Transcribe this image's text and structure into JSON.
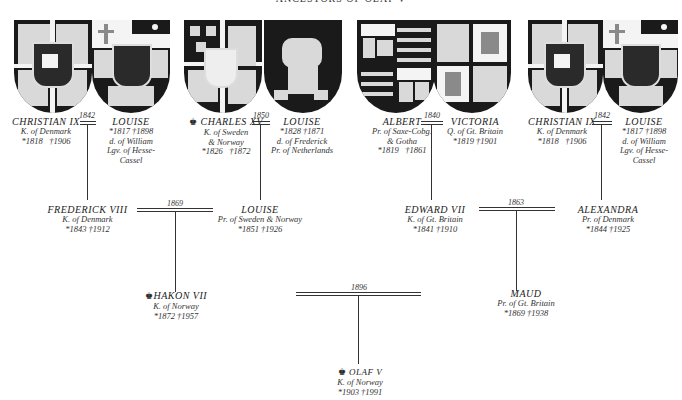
{
  "title": "ANCESTORS OF OLAF V",
  "colors": {
    "ink": "#222222",
    "background": "#ffffff",
    "shield_dark": "#1a1a1a",
    "shield_light": "#d9d9d9"
  },
  "generation1": [
    {
      "husband": {
        "name": "CHRISTIAN IX",
        "title": "K. of Denmark",
        "born": "*1818",
        "died": "†1906",
        "crown": false
      },
      "marriage_year": "1842",
      "wife": {
        "name": "LOUISE",
        "dates": "*1817   †1898",
        "title_line1": "d. of William",
        "title_line2": "Lgv. of Hesse-",
        "title_line3": "Cassel"
      }
    },
    {
      "husband": {
        "name": "CHARLES XV",
        "title_line1": "K. of Sweden",
        "title_line2": "& Norway",
        "born": "*1826",
        "died": "†1872",
        "crown": true
      },
      "marriage_year": "1850",
      "wife": {
        "name": "LOUISE",
        "dates": "*1828   †1871",
        "title_line1": "d. of Frederick",
        "title_line2": "Pr. of Netherlands"
      }
    },
    {
      "husband": {
        "name": "ALBERT",
        "title_line1": "Pr. of Saxe-Cobg.",
        "title_line2": "& Gotha",
        "born": "*1819",
        "died": "†1861"
      },
      "marriage_year": "1840",
      "wife": {
        "name": "VICTORIA",
        "title": "Q. of Gt. Britain",
        "dates": "*1819   †1901"
      }
    },
    {
      "husband": {
        "name": "CHRISTIAN IX",
        "title": "K. of Denmark",
        "born": "*1818",
        "died": "†1906"
      },
      "marriage_year": "1842",
      "wife": {
        "name": "LOUISE",
        "dates": "*1817   †1898",
        "title_line1": "d. of William",
        "title_line2": "Lgv. of Hesse-",
        "title_line3": "Cassel"
      }
    }
  ],
  "generation2": [
    {
      "husband": {
        "name": "FREDERICK VIII",
        "title": "K. of Denmark",
        "dates": "*1843   †1912"
      },
      "marriage_year": "1869",
      "wife": {
        "name": "LOUISE",
        "title": "Pr. of Sweden & Norway",
        "dates": "*1851   †1926"
      }
    },
    {
      "husband": {
        "name": "EDWARD VII",
        "title": "K. of Gt. Britain",
        "dates": "*1841   †1910"
      },
      "marriage_year": "1863",
      "wife": {
        "name": "ALEXANDRA",
        "title": "Pr. of Denmark",
        "dates": "*1844   †1925"
      }
    }
  ],
  "generation3": {
    "husband": {
      "name": "HAKON VII",
      "title": "K. of Norway",
      "dates": "*1872   †1957",
      "crown": true
    },
    "marriage_year": "1896",
    "wife": {
      "name": "MAUD",
      "title": "Pr. of Gt. Britain",
      "dates": "*1869   †1938"
    }
  },
  "generation4": {
    "name": "OLAF V",
    "title": "K. of Norway",
    "dates": "*1903   †1991",
    "crown": true
  },
  "icons": {
    "crown": "♚"
  }
}
